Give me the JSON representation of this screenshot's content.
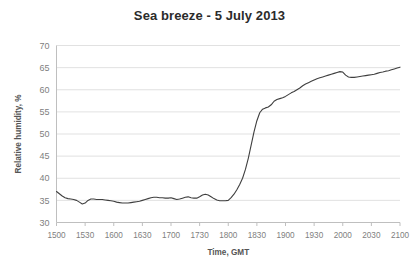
{
  "chart_data": {
    "type": "line",
    "title": "Sea breeze - 5 July 2013",
    "xlabel": "Time, GMT",
    "ylabel": "Relative humidity, %",
    "grid": true,
    "legend": false,
    "ylim": [
      30,
      70
    ],
    "yticks": [
      30,
      35,
      40,
      45,
      50,
      55,
      60,
      65,
      70
    ],
    "ytick_labels": [
      "30",
      "35",
      "40",
      "45",
      "50",
      "55",
      "60",
      "65",
      "70"
    ],
    "xlim": [
      1500,
      2100
    ],
    "xticks": [
      1500,
      1530,
      1600,
      1630,
      1700,
      1730,
      1800,
      1830,
      1900,
      1930,
      2000,
      2030,
      2100
    ],
    "xtick_labels": [
      "1500",
      "1530",
      "1600",
      "1630",
      "1700",
      "1730",
      "1800",
      "1830",
      "1900",
      "1930",
      "2000",
      "2030",
      "2100"
    ],
    "series": [
      {
        "name": "Relative humidity",
        "color": "#3f3f3f",
        "x": [
          1500,
          1503,
          1506,
          1509,
          1512,
          1515,
          1518,
          1521,
          1524,
          1527,
          1530,
          1533,
          1536,
          1539,
          1542,
          1545,
          1548,
          1551,
          1554,
          1557,
          1600,
          1603,
          1606,
          1609,
          1612,
          1615,
          1618,
          1621,
          1624,
          1627,
          1630,
          1633,
          1636,
          1639,
          1642,
          1645,
          1648,
          1651,
          1654,
          1657,
          1700,
          1703,
          1706,
          1709,
          1712,
          1715,
          1718,
          1721,
          1724,
          1727,
          1730,
          1733,
          1736,
          1739,
          1742,
          1745,
          1748,
          1751,
          1754,
          1757,
          1800,
          1803,
          1806,
          1809,
          1812,
          1815,
          1818,
          1821,
          1824,
          1827,
          1830,
          1833,
          1836,
          1839,
          1842,
          1845,
          1848,
          1851,
          1854,
          1857,
          1900,
          1903,
          1906,
          1909,
          1912,
          1915,
          1918,
          1921,
          1924,
          1927,
          1930,
          1933,
          1936,
          1939,
          1942,
          1945,
          1948,
          1951,
          1954,
          1957,
          2000,
          2003,
          2006,
          2009,
          2012,
          2015,
          2018,
          2021,
          2024,
          2027,
          2030,
          2033,
          2036,
          2039,
          2042,
          2045,
          2048,
          2051,
          2054,
          2057,
          2100
        ],
        "y": [
          37.0,
          36.5,
          36.0,
          35.6,
          35.4,
          35.3,
          35.2,
          35.0,
          34.6,
          34.2,
          34.4,
          35.0,
          35.3,
          35.3,
          35.2,
          35.2,
          35.2,
          35.1,
          35.0,
          34.9,
          34.8,
          34.6,
          34.5,
          34.4,
          34.4,
          34.4,
          34.5,
          34.6,
          34.7,
          34.8,
          35.0,
          35.2,
          35.4,
          35.6,
          35.7,
          35.7,
          35.6,
          35.6,
          35.5,
          35.5,
          35.6,
          35.4,
          35.2,
          35.3,
          35.5,
          35.7,
          35.8,
          35.6,
          35.5,
          35.5,
          35.8,
          36.2,
          36.4,
          36.2,
          35.8,
          35.4,
          35.1,
          34.9,
          34.9,
          34.9,
          35.0,
          35.6,
          36.4,
          37.4,
          38.6,
          40.0,
          42.0,
          44.5,
          47.5,
          50.5,
          53.0,
          54.8,
          55.6,
          55.9,
          56.1,
          56.6,
          57.4,
          57.8,
          58.0,
          58.2,
          58.5,
          58.9,
          59.3,
          59.6,
          60.0,
          60.4,
          60.9,
          61.3,
          61.6,
          61.9,
          62.2,
          62.5,
          62.7,
          62.9,
          63.1,
          63.3,
          63.5,
          63.7,
          63.9,
          64.1,
          64.0,
          63.3,
          62.9,
          62.8,
          62.8,
          62.9,
          63.0,
          63.1,
          63.2,
          63.3,
          63.4,
          63.5,
          63.7,
          63.9,
          64.0,
          64.2,
          64.3,
          64.5,
          64.7,
          64.9,
          65.1
        ]
      }
    ]
  }
}
